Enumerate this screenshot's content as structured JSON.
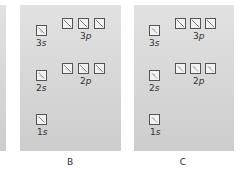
{
  "panels": [
    {
      "id": "B",
      "caption": "B",
      "orbitals": [
        {
          "label_n": "3",
          "label_l": "s",
          "boxes": [
            {
              "arrows": "up-down"
            }
          ]
        },
        {
          "label_n": "3",
          "label_l": "p",
          "boxes": [
            {
              "arrows": "single"
            },
            {
              "arrows": "single"
            },
            {
              "arrows": "single"
            }
          ]
        },
        {
          "label_n": "2",
          "label_l": "s",
          "boxes": [
            {
              "arrows": "up-down"
            }
          ]
        },
        {
          "label_n": "2",
          "label_l": "p",
          "boxes": [
            {
              "arrows": "up-down"
            },
            {
              "arrows": "up-down"
            },
            {
              "arrows": "up-down"
            }
          ]
        },
        {
          "label_n": "1",
          "label_l": "s",
          "boxes": [
            {
              "arrows": "single"
            }
          ]
        }
      ]
    },
    {
      "id": "C",
      "caption": "C",
      "orbitals": [
        {
          "label_n": "3",
          "label_l": "s",
          "boxes": [
            {
              "arrows": "up-down"
            }
          ]
        },
        {
          "label_n": "3",
          "label_l": "p",
          "boxes": [
            {
              "arrows": "single"
            },
            {
              "arrows": "single"
            },
            {
              "arrows": "single"
            }
          ]
        },
        {
          "label_n": "2",
          "label_l": "s",
          "boxes": [
            {
              "arrows": "up-down"
            }
          ]
        },
        {
          "label_n": "2",
          "label_l": "p",
          "boxes": [
            {
              "arrows": "up-down"
            },
            {
              "arrows": "up-down"
            },
            {
              "arrows": "up-down"
            }
          ]
        },
        {
          "label_n": "1",
          "label_l": "s",
          "boxes": [
            {
              "arrows": "up-down"
            }
          ]
        }
      ]
    }
  ],
  "labels": {
    "B": {
      "s3": "3",
      "p3": "3",
      "s2": "2",
      "p2": "2",
      "s1": "1",
      "cap": "B"
    },
    "C": {
      "s3": "3",
      "p3": "3",
      "s2": "2",
      "p2": "2",
      "s1": "1",
      "cap": "C"
    },
    "s": "s",
    "p": "p"
  }
}
